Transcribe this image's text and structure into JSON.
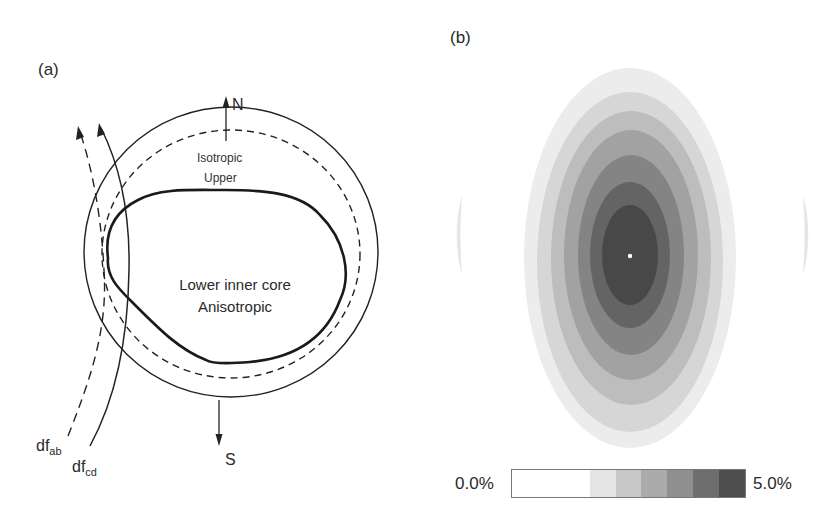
{
  "panel_a": {
    "label": "(a)",
    "north_label": "N",
    "south_label": "S",
    "outer_layer_label_1": "Isotropic",
    "outer_layer_label_2": "Upper",
    "core_label_1": "Lower inner core",
    "core_label_2": "Anisotropic",
    "ray_ab": {
      "base": "df",
      "sub": "ab",
      "style": "dashed"
    },
    "ray_cd": {
      "base": "df",
      "sub": "cd",
      "style": "solid"
    }
  },
  "panel_b": {
    "label": "(b)",
    "colorbar": {
      "min_label": "0.0%",
      "max_label": "5.0%",
      "segments": [
        {
          "color": "#ffffff",
          "flex": 3
        },
        {
          "color": "#e4e4e4",
          "flex": 1
        },
        {
          "color": "#c8c8c8",
          "flex": 1
        },
        {
          "color": "#ababab",
          "flex": 1
        },
        {
          "color": "#8f8f8f",
          "flex": 1
        },
        {
          "color": "#6e6e6e",
          "flex": 1
        },
        {
          "color": "#4e4e4e",
          "flex": 1
        }
      ]
    },
    "contour_colors": [
      "#ececec",
      "#d6d6d6",
      "#bdbdbd",
      "#a2a2a2",
      "#848484",
      "#646464",
      "#484848"
    ]
  }
}
